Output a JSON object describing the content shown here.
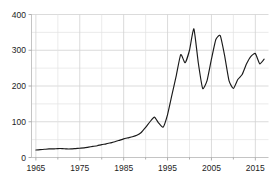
{
  "chart_data": {
    "type": "line",
    "title": "",
    "subtitle": "",
    "xlabel": "",
    "ylabel": "",
    "xlim": [
      1964,
      2018
    ],
    "ylim": [
      0,
      400
    ],
    "grid": true,
    "legend": null,
    "legend_position": "none",
    "annotations": [],
    "series_color": "#1a1a1a",
    "grid_color": "#e2e2e2",
    "axis_color": "#bdbdbd",
    "x_ticks": [
      1965,
      1975,
      1985,
      1995,
      2005,
      2015
    ],
    "x_tick_labels": [
      "1965",
      "1975",
      "1985",
      "1995",
      "2005",
      "2015"
    ],
    "x_minor_ticks": [
      1970,
      1980,
      1990,
      2000,
      2010
    ],
    "y_ticks": [
      0,
      100,
      200,
      300,
      400
    ],
    "y_tick_labels": [
      "0",
      "100",
      "200",
      "300",
      "400"
    ],
    "y_minor_ticks": [
      50,
      150,
      250,
      350
    ],
    "series": [
      {
        "name": "series-1",
        "x": [
          1965,
          1966,
          1967,
          1968,
          1969,
          1970,
          1971,
          1972,
          1973,
          1974,
          1975,
          1976,
          1977,
          1978,
          1979,
          1980,
          1981,
          1982,
          1983,
          1984,
          1985,
          1986,
          1987,
          1988,
          1989,
          1990,
          1991,
          1992,
          1993,
          1994,
          1995,
          1996,
          1997,
          1998,
          1999,
          2000,
          2001,
          2002,
          2003,
          2004,
          2005,
          2006,
          2007,
          2008,
          2009,
          2010,
          2011,
          2012,
          2013,
          2014,
          2015,
          2016,
          2017
        ],
        "values": [
          21,
          22,
          23,
          24,
          24,
          25,
          25,
          24,
          24,
          25,
          26,
          27,
          29,
          31,
          33,
          36,
          38,
          41,
          44,
          48,
          52,
          55,
          58,
          62,
          70,
          84,
          100,
          113,
          96,
          85,
          120,
          175,
          230,
          288,
          265,
          300,
          360,
          265,
          193,
          215,
          275,
          330,
          341,
          285,
          215,
          193,
          218,
          232,
          262,
          283,
          291,
          262,
          275
        ]
      }
    ]
  }
}
